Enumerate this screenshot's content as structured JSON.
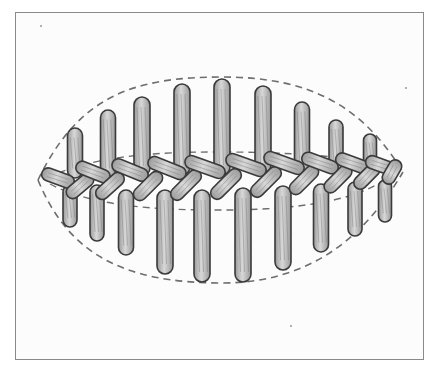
{
  "figure": {
    "frame": {
      "x": 15,
      "y": 12,
      "width": 409,
      "height": 348,
      "stroke": "#8a8a8a"
    },
    "colors": {
      "stitch_fill_light": "#d8d8d8",
      "stitch_fill_dark": "#9a9a9a",
      "stitch_outline": "#3a3a3a",
      "guide_dash": "#6e6e6e",
      "background": "#fcfcfc"
    },
    "outline": {
      "left_tip": [
        38,
        180
      ],
      "right_tip": [
        403,
        172
      ],
      "top_peak": [
        222,
        77
      ],
      "bottom_trough": [
        222,
        283
      ]
    },
    "inner_guides": {
      "upper_y": 152,
      "lower_y": 210
    },
    "upper_stitches": [
      {
        "x": 75,
        "top": 128,
        "bottom": 178,
        "w": 15
      },
      {
        "x": 108,
        "top": 110,
        "bottom": 178,
        "w": 15
      },
      {
        "x": 142,
        "top": 97,
        "bottom": 176,
        "w": 16
      },
      {
        "x": 182,
        "top": 84,
        "bottom": 175,
        "w": 16
      },
      {
        "x": 222,
        "top": 79,
        "bottom": 175,
        "w": 16
      },
      {
        "x": 263,
        "top": 86,
        "bottom": 173,
        "w": 16
      },
      {
        "x": 302,
        "top": 102,
        "bottom": 172,
        "w": 15
      },
      {
        "x": 336,
        "top": 120,
        "bottom": 172,
        "w": 14
      },
      {
        "x": 370,
        "top": 134,
        "bottom": 172,
        "w": 13
      }
    ],
    "lower_stitches": [
      {
        "x": 70,
        "top": 185,
        "bottom": 227,
        "w": 14
      },
      {
        "x": 97,
        "top": 185,
        "bottom": 241,
        "w": 14
      },
      {
        "x": 126,
        "top": 190,
        "bottom": 255,
        "w": 15
      },
      {
        "x": 165,
        "top": 190,
        "bottom": 274,
        "w": 16
      },
      {
        "x": 202,
        "top": 190,
        "bottom": 282,
        "w": 16
      },
      {
        "x": 243,
        "top": 188,
        "bottom": 282,
        "w": 16
      },
      {
        "x": 283,
        "top": 186,
        "bottom": 270,
        "w": 16
      },
      {
        "x": 321,
        "top": 184,
        "bottom": 252,
        "w": 15
      },
      {
        "x": 355,
        "top": 182,
        "bottom": 236,
        "w": 14
      },
      {
        "x": 385,
        "top": 180,
        "bottom": 222,
        "w": 13
      }
    ],
    "cross_stitches": [
      {
        "cx": 58,
        "cy": 178,
        "len": 34,
        "angle": 20
      },
      {
        "cx": 80,
        "cy": 186,
        "len": 32,
        "angle": -40
      },
      {
        "cx": 93,
        "cy": 172,
        "len": 36,
        "angle": 22
      },
      {
        "cx": 110,
        "cy": 186,
        "len": 34,
        "angle": -42
      },
      {
        "cx": 130,
        "cy": 170,
        "len": 38,
        "angle": 22
      },
      {
        "cx": 148,
        "cy": 186,
        "len": 36,
        "angle": -45
      },
      {
        "cx": 167,
        "cy": 168,
        "len": 40,
        "angle": 22
      },
      {
        "cx": 186,
        "cy": 185,
        "len": 38,
        "angle": -45
      },
      {
        "cx": 205,
        "cy": 167,
        "len": 42,
        "angle": 20
      },
      {
        "cx": 226,
        "cy": 184,
        "len": 38,
        "angle": -45
      },
      {
        "cx": 246,
        "cy": 165,
        "len": 42,
        "angle": 20
      },
      {
        "cx": 266,
        "cy": 182,
        "len": 38,
        "angle": -45
      },
      {
        "cx": 284,
        "cy": 163,
        "len": 42,
        "angle": 20
      },
      {
        "cx": 304,
        "cy": 180,
        "len": 36,
        "angle": -45
      },
      {
        "cx": 320,
        "cy": 163,
        "len": 38,
        "angle": 20
      },
      {
        "cx": 338,
        "cy": 179,
        "len": 34,
        "angle": -45
      },
      {
        "cx": 352,
        "cy": 163,
        "len": 34,
        "angle": 20
      },
      {
        "cx": 367,
        "cy": 176,
        "len": 32,
        "angle": -45
      },
      {
        "cx": 380,
        "cy": 165,
        "len": 30,
        "angle": 20
      },
      {
        "cx": 392,
        "cy": 172,
        "len": 26,
        "angle": -60
      }
    ],
    "specks": [
      [
        40,
        25
      ],
      [
        405,
        87
      ],
      [
        290,
        325
      ]
    ]
  }
}
